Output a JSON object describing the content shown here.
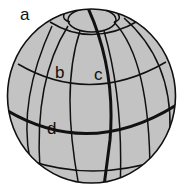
{
  "diagram": {
    "labels": {
      "a": "a",
      "b": "b",
      "c": "c",
      "d": "d"
    },
    "caption_partial": "",
    "colors": {
      "globe_fill": "#c3c3c3",
      "line": "#111111",
      "background": "#ffffff"
    }
  }
}
